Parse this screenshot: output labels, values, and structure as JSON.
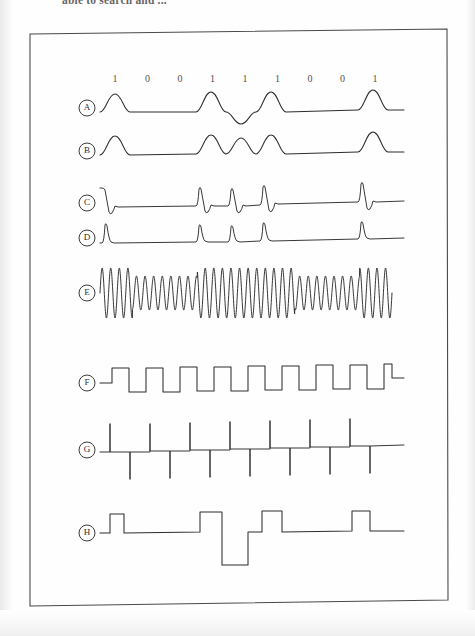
{
  "page": {
    "running_text": "able to search and ...",
    "width": 475,
    "height": 636,
    "background_color": "#fefefe",
    "ink_color": "#2d2d2d"
  },
  "figure": {
    "frame": {
      "x": 28,
      "y": 30,
      "width": 420,
      "height": 575
    },
    "bit_sequence_label": "1 0 0 1 1 1 0 0 1",
    "bits": [
      "1",
      "0",
      "0",
      "1",
      "1",
      "1",
      "0",
      "0",
      "1"
    ],
    "bit_row_y": 74,
    "bit_start_x": 115,
    "bit_spacing": 32.5,
    "traces": [
      {
        "id": "A",
        "label": "A",
        "name": "trace-a",
        "description": "rounded bipolar pulses, third mark inverted",
        "baseline_y": 108,
        "label_x": 87
      },
      {
        "id": "B",
        "label": "B",
        "name": "trace-b",
        "description": "rounded unipolar pulses on every mark",
        "baseline_y": 151,
        "label_x": 87
      },
      {
        "id": "C",
        "label": "C",
        "name": "trace-c",
        "description": "sharp bipolar doublet spikes, positive then negative",
        "baseline_y": 203,
        "label_x": 87
      },
      {
        "id": "D",
        "label": "D",
        "name": "trace-d",
        "description": "sharp unipolar impulse spikes",
        "baseline_y": 238,
        "label_x": 87
      },
      {
        "id": "E",
        "label": "E",
        "name": "trace-e",
        "description": "amplitude modulated sine carrier",
        "baseline_y": 293,
        "label_x": 87
      },
      {
        "id": "F",
        "label": "F",
        "name": "trace-f",
        "description": "square wave clock, alternating high and low levels",
        "baseline_y": 383,
        "label_x": 87
      },
      {
        "id": "G",
        "label": "G",
        "name": "trace-g",
        "description": "alternating up and down impulses on a baseline",
        "baseline_y": 450,
        "label_x": 87
      },
      {
        "id": "H",
        "label": "H",
        "name": "trace-h",
        "description": "bipolar return to zero pulses of alternating polarity",
        "baseline_y": 533,
        "label_x": 87
      }
    ]
  }
}
